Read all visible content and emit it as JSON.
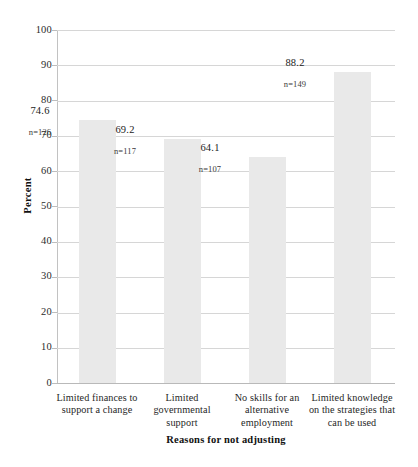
{
  "chart_data": {
    "type": "bar",
    "title": "",
    "xlabel": "Reasons for not adjusting",
    "ylabel": "Percent",
    "ylim": [
      0,
      100
    ],
    "ytick_step": 10,
    "yticks": [
      100,
      90,
      80,
      70,
      60,
      50,
      40,
      30,
      20,
      10,
      0
    ],
    "grid": true,
    "legend": "none",
    "bar_color": "#e9e9e9",
    "categories": [
      "Limited finances to support a change",
      "Limited governmental support",
      "No skills for an alternative employment",
      "Limited knowledge on the strategies that can be used"
    ],
    "category_lines": [
      [
        "Limited finances to",
        "support a change"
      ],
      [
        "Limited",
        "governmental",
        "support"
      ],
      [
        "No skills for an",
        "alternative",
        "employment"
      ],
      [
        "Limited knowledge",
        "on the strategies that",
        "can be used"
      ]
    ],
    "values": [
      74.6,
      69.2,
      64.1,
      88.2
    ],
    "value_labels": [
      "74.6",
      "69.2",
      "64.1",
      "88.2"
    ],
    "counts": [
      126,
      117,
      107,
      149
    ],
    "count_labels": [
      "n=126",
      "n=117",
      "n=107",
      "n=149"
    ]
  }
}
